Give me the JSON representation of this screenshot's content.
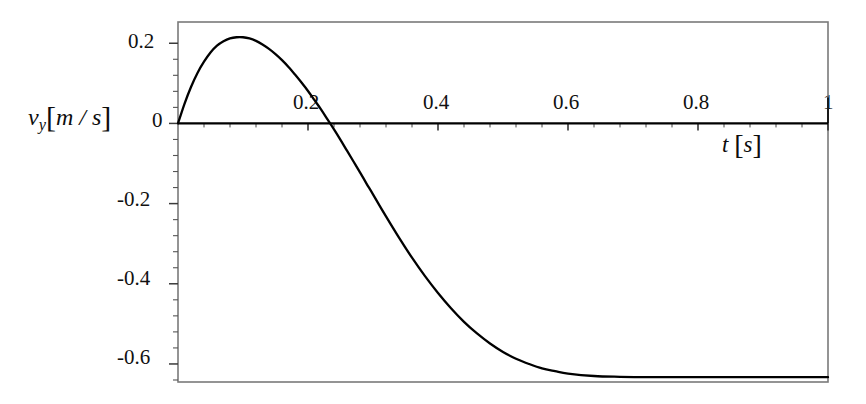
{
  "chart_data": {
    "type": "line",
    "title": "",
    "subtitle": "",
    "xlabel": "t [s]",
    "ylabel": "v_y [m/s]",
    "xlabel_parts": {
      "symbol": "t",
      "open": "[",
      "unit": "s",
      "close": "]"
    },
    "ylabel_parts": {
      "symbol": "v",
      "subscript": "y",
      "open": "[",
      "unit": "m / s",
      "close": "]"
    },
    "xlim": [
      0,
      1
    ],
    "ylim": [
      -0.645,
      0.253
    ],
    "xticks": [
      0.2,
      0.4,
      0.6,
      0.8,
      1
    ],
    "xtick_labels": [
      "0.2",
      "0.4",
      "0.6",
      "0.8",
      "1"
    ],
    "yticks": [
      0.2,
      0,
      -0.2,
      -0.4,
      -0.6
    ],
    "ytick_labels": [
      "0.2",
      "0",
      "-0.2",
      "-0.4",
      "-0.6"
    ],
    "xminor_step": 0.04,
    "yminor_step": 0.04,
    "grid": false,
    "legend": "none",
    "zero_line": true,
    "frame": true,
    "line_color": "#000000",
    "frame_color": "#7a7a7a",
    "axis_color": "#000000",
    "annotations": {
      "peak_t": 0.103,
      "peak_v": 0.215,
      "zero_crossing_t": 0.215,
      "terminal_velocity": -0.633
    },
    "series": [
      {
        "name": "v_y(t)",
        "x": [
          0.0,
          0.01,
          0.02,
          0.03,
          0.04,
          0.05,
          0.06,
          0.07,
          0.08,
          0.09,
          0.1,
          0.11,
          0.12,
          0.13,
          0.14,
          0.15,
          0.16,
          0.17,
          0.18,
          0.19,
          0.2,
          0.21,
          0.22,
          0.23,
          0.24,
          0.25,
          0.26,
          0.27,
          0.28,
          0.29,
          0.3,
          0.32,
          0.34,
          0.36,
          0.38,
          0.4,
          0.42,
          0.44,
          0.46,
          0.48,
          0.5,
          0.52,
          0.54,
          0.56,
          0.58,
          0.6,
          0.64,
          0.68,
          0.72,
          0.76,
          0.8,
          0.84,
          0.88,
          0.92,
          0.96,
          1.0
        ],
        "y": [
          0.0,
          0.049,
          0.091,
          0.126,
          0.154,
          0.177,
          0.194,
          0.205,
          0.212,
          0.215,
          0.215,
          0.212,
          0.206,
          0.197,
          0.186,
          0.173,
          0.158,
          0.141,
          0.122,
          0.102,
          0.081,
          0.058,
          0.035,
          0.01,
          -0.015,
          -0.041,
          -0.068,
          -0.095,
          -0.122,
          -0.15,
          -0.177,
          -0.232,
          -0.285,
          -0.335,
          -0.381,
          -0.423,
          -0.461,
          -0.495,
          -0.524,
          -0.549,
          -0.57,
          -0.587,
          -0.6,
          -0.611,
          -0.618,
          -0.624,
          -0.63,
          -0.632,
          -0.633,
          -0.633,
          -0.633,
          -0.633,
          -0.633,
          -0.633,
          -0.633,
          -0.633
        ]
      }
    ]
  }
}
